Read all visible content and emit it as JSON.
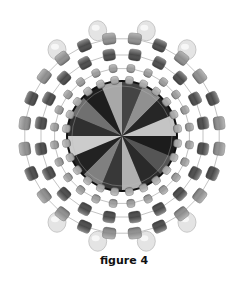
{
  "figure": {
    "caption": "figure 4",
    "center": [
      122,
      136
    ],
    "colors": {
      "background": "#ffffff",
      "thread": "#9a9a9a",
      "outer_bead": "#8e8e8e",
      "dark_bead": "#4a4a4a",
      "small_bead": "#9c9c9c",
      "inner_bead": "#a8a8a8",
      "pale_drop_bead": "#e4e4e4",
      "rivoli_dark": "#1e1e1e",
      "rivoli_light": "#d8d8d8"
    },
    "rings": [
      {
        "name": "pale-drop-beads",
        "radius": 108,
        "count": 8,
        "angles": [
          -103,
          -77,
          -127,
          -53,
          103,
          77,
          127,
          53
        ]
      },
      {
        "name": "outer-ring",
        "radius": 98,
        "count": 24
      },
      {
        "name": "dark-ring",
        "radius": 82,
        "count": 20
      },
      {
        "name": "small-ring",
        "radius": 68,
        "count": 24
      },
      {
        "name": "inner-ring",
        "radius": 56,
        "count": 24
      }
    ],
    "rivoli": {
      "radius": 54,
      "facets": 16
    }
  }
}
